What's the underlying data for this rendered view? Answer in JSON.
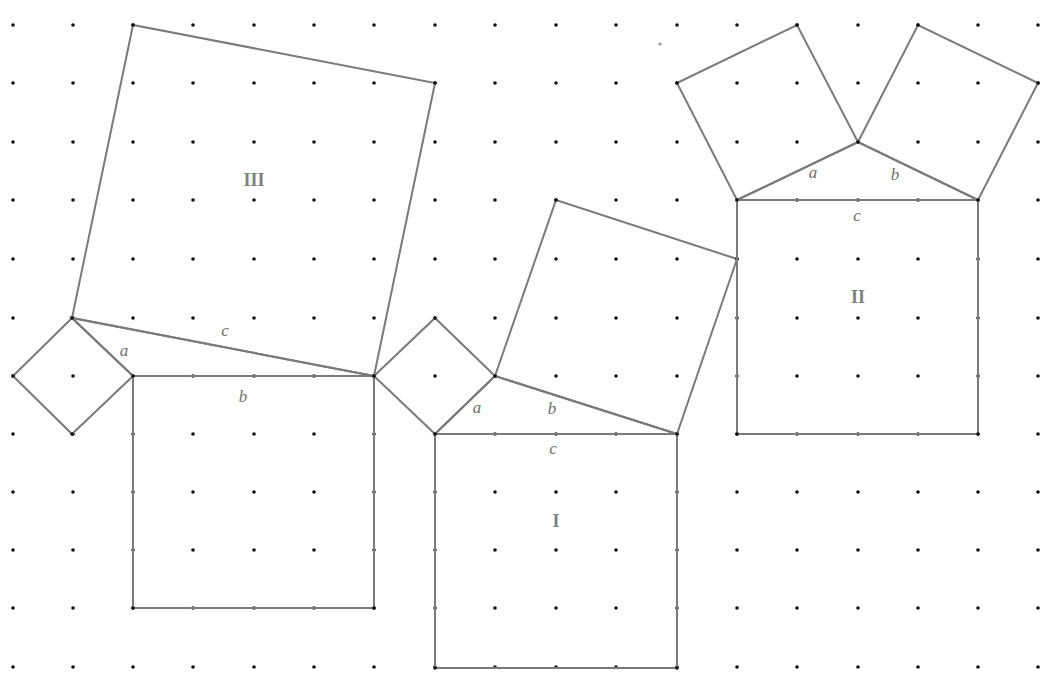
{
  "diagram": {
    "colors": {
      "line": "#7a7a7a",
      "dot": "#111111",
      "label": "#808080",
      "side_label": "#6e6e6e",
      "background": "#ffffff"
    },
    "grid": {
      "x": [
        13,
        73,
        133,
        193,
        254,
        314,
        374,
        435,
        495,
        556,
        616,
        677,
        737,
        797,
        858,
        918,
        978,
        1038
      ],
      "y": [
        25,
        83,
        142,
        200,
        259,
        318,
        376,
        434,
        492,
        550,
        608,
        667
      ],
      "dot_radius": 1.8
    },
    "stray_marks": [
      {
        "x": 660,
        "y": 44,
        "r": 1.6,
        "color": "#999999"
      }
    ],
    "figures": [
      {
        "id": "III",
        "label": "III",
        "label_pos": [
          254,
          186
        ],
        "triangle": [
          [
            72,
            318
          ],
          [
            133,
            376
          ],
          [
            374,
            376
          ]
        ],
        "squares": [
          {
            "side": "a",
            "points": [
              [
                72,
                318
              ],
              [
                13,
                376
              ],
              [
                72,
                434
              ],
              [
                133,
                376
              ]
            ]
          },
          {
            "side": "b",
            "points": [
              [
                133,
                376
              ],
              [
                374,
                376
              ],
              [
                374,
                608
              ],
              [
                133,
                608
              ]
            ]
          },
          {
            "side": "c",
            "points": [
              [
                72,
                318
              ],
              [
                133,
                25
              ],
              [
                435,
                83
              ],
              [
                374,
                376
              ]
            ]
          }
        ],
        "side_labels": [
          {
            "text": "a",
            "x": 124,
            "y": 356
          },
          {
            "text": "b",
            "x": 243,
            "y": 402
          },
          {
            "text": "c",
            "x": 225,
            "y": 336
          }
        ]
      },
      {
        "id": "I",
        "label": "I",
        "label_pos": [
          556,
          527
        ],
        "triangle": [
          [
            435,
            434
          ],
          [
            495,
            376
          ],
          [
            677,
            434
          ]
        ],
        "squares": [
          {
            "side": "a",
            "points": [
              [
                435,
                434
              ],
              [
                374,
                376
              ],
              [
                435,
                318
              ],
              [
                495,
                376
              ]
            ]
          },
          {
            "side": "b",
            "points": [
              [
                495,
                376
              ],
              [
                556,
                200
              ],
              [
                737,
                259
              ],
              [
                677,
                434
              ]
            ]
          },
          {
            "side": "c",
            "points": [
              [
                435,
                434
              ],
              [
                677,
                434
              ],
              [
                677,
                668
              ],
              [
                435,
                668
              ]
            ]
          }
        ],
        "side_labels": [
          {
            "text": "a",
            "x": 477,
            "y": 413
          },
          {
            "text": "b",
            "x": 552,
            "y": 414
          },
          {
            "text": "c",
            "x": 553,
            "y": 454
          }
        ]
      },
      {
        "id": "II",
        "label": "II",
        "label_pos": [
          858,
          303
        ],
        "triangle": [
          [
            737,
            200
          ],
          [
            858,
            142
          ],
          [
            978,
            200
          ]
        ],
        "squares": [
          {
            "side": "a",
            "points": [
              [
                737,
                200
              ],
              [
                677,
                83
              ],
              [
                797,
                25
              ],
              [
                858,
                142
              ]
            ]
          },
          {
            "side": "b",
            "points": [
              [
                858,
                142
              ],
              [
                918,
                25
              ],
              [
                1038,
                83
              ],
              [
                978,
                200
              ]
            ]
          },
          {
            "side": "c",
            "points": [
              [
                737,
                200
              ],
              [
                978,
                200
              ],
              [
                978,
                434
              ],
              [
                737,
                434
              ]
            ]
          }
        ],
        "side_labels": [
          {
            "text": "a",
            "x": 813,
            "y": 178
          },
          {
            "text": "b",
            "x": 895,
            "y": 180
          },
          {
            "text": "c",
            "x": 857,
            "y": 221
          }
        ]
      }
    ]
  }
}
